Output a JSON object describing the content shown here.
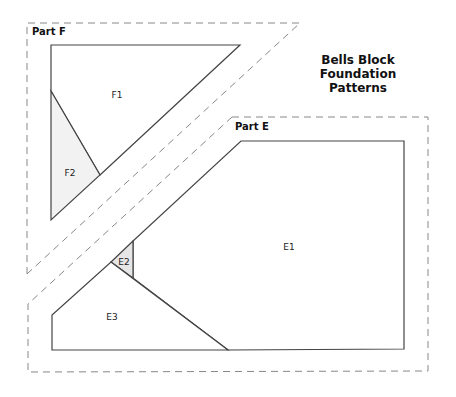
{
  "title": {
    "line1": "Bells Block",
    "line2": "Foundation Patterns"
  },
  "parts": [
    {
      "name": "Part F",
      "label_pos": [
        32,
        24
      ],
      "cut_line_points": "27,23 300,23 27,274",
      "pieces": [
        {
          "id": "F1",
          "label": "F1",
          "fill": "#ffffff",
          "points": "51,45 240,45 100,175 51,91",
          "label_pos": [
            117,
            95
          ]
        },
        {
          "id": "F2",
          "label": "F2",
          "fill": "#f2f2f2",
          "points": "51,91 100,175 51,220",
          "label_pos": [
            70,
            172
          ]
        }
      ],
      "outline_points": "51,45 240,45 51,220"
    },
    {
      "name": "Part E",
      "label_pos": [
        235,
        122
      ],
      "cut_line_points": "232,117 428,117 428,371 28,372 28,304",
      "pieces": [
        {
          "id": "E1",
          "label": "E1",
          "fill": "#ffffff",
          "points": "241,141 404,141 404,349 228,350 133,278 133,241",
          "label_pos": [
            289,
            247
          ]
        },
        {
          "id": "E2",
          "label": "E2",
          "fill": "#e6e6e6",
          "points": "133,241 111,262 133,278",
          "label_pos": [
            124,
            262
          ]
        },
        {
          "id": "E3",
          "label": "E3",
          "fill": "#ffffff",
          "points": "111,262 228,350 52,350 52,315",
          "label_pos": [
            112,
            317
          ]
        }
      ],
      "outline_points": "241,141 404,141 404,349 52,350 52,315"
    }
  ],
  "colors": {
    "outline": "#444444",
    "cut_line": "#888888",
    "shaded_light": "#f2f2f2",
    "shaded_dark": "#e6e6e6"
  }
}
